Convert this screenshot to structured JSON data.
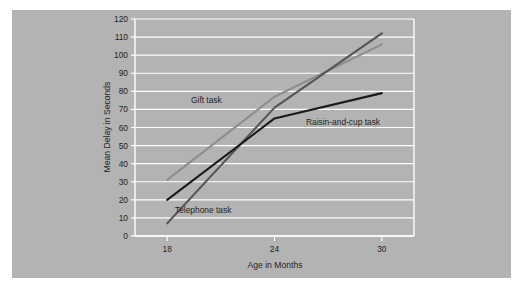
{
  "figure": {
    "background_color": "#ffffff",
    "panel_color": "#b3b3b3",
    "plot_color": "#b3b3b3",
    "gridline_color": "#ffffff"
  },
  "chart_data": {
    "type": "line",
    "title": "",
    "xlabel": "Age in Months",
    "ylabel": "Mean Delay in Seconds",
    "x": [
      18,
      24,
      30
    ],
    "xticklabels": [
      "18",
      "24",
      "30"
    ],
    "xlim": [
      16.2,
      31.8
    ],
    "ylim": [
      0,
      120
    ],
    "yticks": [
      0,
      10,
      20,
      30,
      40,
      50,
      60,
      70,
      80,
      90,
      100,
      110,
      120
    ],
    "yticklabels": [
      "0",
      "10",
      "20",
      "30",
      "40",
      "50",
      "60",
      "70",
      "80",
      "90",
      "100",
      "110",
      "120"
    ],
    "grid": "horizontal",
    "legend": "inline-labels",
    "series": [
      {
        "name": "Gift task",
        "values": [
          31,
          77,
          106
        ],
        "color": "#8e8e8e",
        "linewidth": 2.1
      },
      {
        "name": "Telephone task",
        "values": [
          7,
          71,
          112
        ],
        "color": "#555555",
        "linewidth": 2.1
      },
      {
        "name": "Raisin-and-cup task",
        "values": [
          20,
          65,
          79
        ],
        "color": "#1a1a1a",
        "linewidth": 2.1
      }
    ],
    "annotations": [
      {
        "text": "Gift task",
        "x_px": 191,
        "y_px": 103
      },
      {
        "text": "Telephone task",
        "x_px": 175,
        "y_px": 213
      },
      {
        "text": "Raisin-and-cup task",
        "x_px": 306,
        "y_px": 125
      }
    ]
  }
}
